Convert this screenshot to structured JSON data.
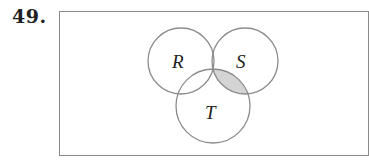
{
  "problem": {
    "number": "49."
  },
  "venn": {
    "sets": [
      {
        "name": "R",
        "cx": 181,
        "cy": 61,
        "r": 33
      },
      {
        "name": "S",
        "cx": 245,
        "cy": 61,
        "r": 33
      },
      {
        "name": "T",
        "cx": 213,
        "cy": 106,
        "r": 37
      }
    ],
    "labels": {
      "R": "R",
      "S": "S",
      "T": "T"
    },
    "shaded_region": "(S ∩ T) − R",
    "colors": {
      "stroke": "#8c8c8c",
      "shade": "#d4d4d4",
      "frame": "#8a8a8a"
    }
  }
}
